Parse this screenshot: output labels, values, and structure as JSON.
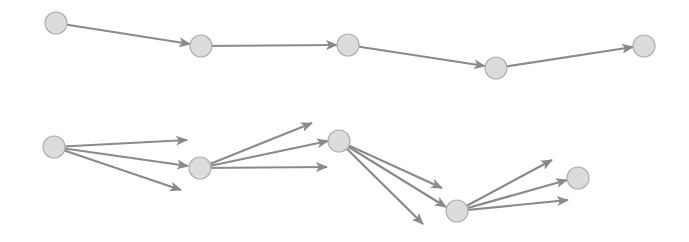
{
  "diagram": {
    "colors": {
      "background": "#ffffff",
      "node_fill": "#dcdcdc",
      "node_stroke": "#b0b0b0",
      "edge": "#8a8a8a"
    },
    "node_radius": 11,
    "top_row": {
      "nodes": [
        {
          "id": "t1",
          "x": 56,
          "y": 23
        },
        {
          "id": "t2",
          "x": 201,
          "y": 46
        },
        {
          "id": "t3",
          "x": 348,
          "y": 45
        },
        {
          "id": "t4",
          "x": 496,
          "y": 68
        },
        {
          "id": "t5",
          "x": 644,
          "y": 46
        }
      ],
      "edges": [
        {
          "from": [
            56,
            23
          ],
          "to": [
            190,
            44
          ]
        },
        {
          "from": [
            201,
            46
          ],
          "to": [
            337,
            45
          ]
        },
        {
          "from": [
            348,
            45
          ],
          "to": [
            485,
            66
          ]
        },
        {
          "from": [
            496,
            68
          ],
          "to": [
            633,
            47
          ]
        }
      ]
    },
    "bottom_row": {
      "nodes": [
        {
          "id": "b1",
          "x": 54,
          "y": 147
        },
        {
          "id": "b2",
          "x": 200,
          "y": 168
        },
        {
          "id": "b3",
          "x": 339,
          "y": 141
        },
        {
          "id": "b4",
          "x": 457,
          "y": 211
        },
        {
          "id": "b5",
          "x": 578,
          "y": 178
        }
      ],
      "edges": [
        {
          "from": [
            54,
            147
          ],
          "to": [
            187,
            140
          ]
        },
        {
          "from": [
            54,
            147
          ],
          "to": [
            188,
            166
          ]
        },
        {
          "from": [
            54,
            147
          ],
          "to": [
            181,
            190
          ]
        },
        {
          "from": [
            200,
            168
          ],
          "to": [
            312,
            123
          ]
        },
        {
          "from": [
            200,
            168
          ],
          "to": [
            328,
            141
          ]
        },
        {
          "from": [
            200,
            168
          ],
          "to": [
            327,
            167
          ]
        },
        {
          "from": [
            339,
            141
          ],
          "to": [
            442,
            188
          ]
        },
        {
          "from": [
            339,
            141
          ],
          "to": [
            446,
            207
          ]
        },
        {
          "from": [
            339,
            141
          ],
          "to": [
            423,
            224
          ]
        },
        {
          "from": [
            457,
            211
          ],
          "to": [
            552,
            160
          ]
        },
        {
          "from": [
            457,
            211
          ],
          "to": [
            567,
            180
          ]
        },
        {
          "from": [
            457,
            211
          ],
          "to": [
            568,
            200
          ]
        }
      ]
    }
  }
}
